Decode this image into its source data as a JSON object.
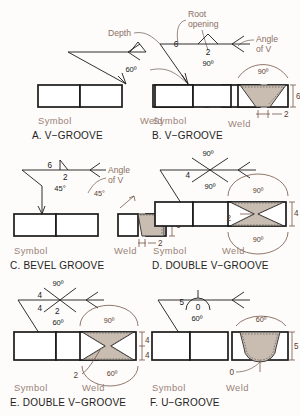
{
  "figure": {
    "background": "#fdfcfa",
    "bead_color": "#c9bdb1",
    "caption_color": "#9b8279",
    "dimension_color": "#5a3b2e",
    "annotation_color": "#8a6d63"
  },
  "column_labels": {
    "symbol": "Symbol",
    "weld": "Weld"
  },
  "callouts": {
    "depth": "Depth",
    "root_opening": "Root opening",
    "angle_of_v": "Angle of V"
  },
  "panels": [
    {
      "id": "a",
      "caption": "A. V−GROOVE",
      "symbol_type": "v-groove",
      "symbol_values": {
        "angle": "60º"
      },
      "weld_values": {},
      "labels": {
        "symbol": "Symbol",
        "weld": "Weld"
      }
    },
    {
      "id": "b",
      "caption": "B. V−GROOVE",
      "symbol_type": "v-groove",
      "symbol_values": {
        "depth": "6",
        "root_opening": "2",
        "angle": "90º"
      },
      "weld_values": {
        "angle": "90º",
        "depth": "6",
        "root": "2"
      },
      "callouts": [
        "Depth",
        "Root opening",
        "Angle of V"
      ],
      "labels": {
        "symbol": "Symbol",
        "weld": "Weld"
      }
    },
    {
      "id": "c",
      "caption": "C. BEVEL GROOVE",
      "symbol_type": "bevel-groove",
      "symbol_values": {
        "depth": "6",
        "root_opening": "2",
        "angle": "45°"
      },
      "weld_values": {
        "angle": "45°",
        "depth": "6",
        "root": "2"
      },
      "callouts": [
        "Angle of V"
      ],
      "labels": {
        "symbol": "Symbol",
        "weld": "Weld"
      }
    },
    {
      "id": "d",
      "caption": "D. DOUBLE V−GROOVE",
      "symbol_type": "double-v-groove",
      "symbol_values": {
        "angle_top": "90º",
        "depth": "4",
        "angle_bottom": "90º"
      },
      "weld_values": {
        "angle_top": "90º",
        "angle_bottom": "90º",
        "depth": "4",
        "root": "2"
      },
      "labels": {
        "symbol": "Symbol",
        "weld": "Weld"
      }
    },
    {
      "id": "e",
      "caption": "E. DOUBLE V−GROOVE",
      "symbol_type": "double-v-groove",
      "symbol_values": {
        "angle_top": "90º",
        "depth_top": "4",
        "depth_bottom": "4",
        "root_opening": "2",
        "angle_bottom": "60º"
      },
      "weld_values": {
        "angle_top": "90º",
        "angle_bottom": "60º",
        "depth_top": "4",
        "depth_bottom": "4",
        "root": "2"
      },
      "labels": {
        "symbol": "Symbol",
        "weld": "Weld"
      }
    },
    {
      "id": "f",
      "caption": "F. U−GROOVE",
      "symbol_type": "u-groove",
      "symbol_values": {
        "depth": "5",
        "root_opening": "0",
        "angle": "60º"
      },
      "weld_values": {
        "angle": "60º",
        "depth": "5",
        "root": "0"
      },
      "labels": {
        "symbol": "Symbol",
        "weld": "Weld"
      }
    }
  ]
}
